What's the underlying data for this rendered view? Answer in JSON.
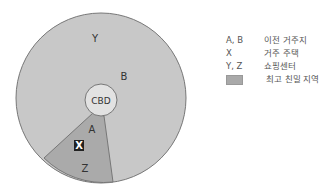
{
  "diagram": {
    "center_label": "CBD",
    "zone_labels": {
      "y": "Y",
      "b": "B",
      "a": "A",
      "x": "X",
      "z": "Z"
    },
    "colors": {
      "outer_area": "#c8c8c8",
      "wedge_area": "#aaaaaa",
      "cbd_fill": "#e2e2e2",
      "stroke": "#777777"
    }
  },
  "legend": {
    "items": [
      {
        "key": "A, B",
        "label": "이전 거주지"
      },
      {
        "key": "X",
        "label": "거주 주택"
      },
      {
        "key": "Y, Z",
        "label": "쇼핑센터"
      },
      {
        "key": "",
        "label": "최고 친밀 지역",
        "swatch": true
      }
    ]
  }
}
